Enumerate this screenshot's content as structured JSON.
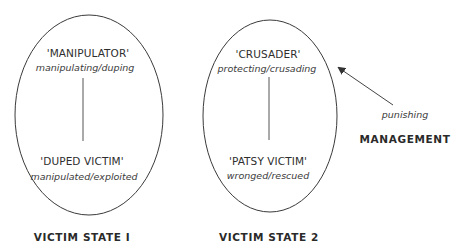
{
  "state1": {
    "top_role": "'MANIPULATOR'",
    "top_verb": "manipulating/duping",
    "bottom_role": "'DUPED VICTIM'",
    "bottom_verb": "manipulated/exploited",
    "title": "VICTIM STATE I"
  },
  "state2": {
    "top_role": "'CRUSADER'",
    "top_verb": "protecting/crusading",
    "bottom_role": "'PATSY VICTIM'",
    "bottom_verb": "wronged/rescued",
    "title": "VICTIM STATE 2"
  },
  "management": {
    "arrow_label": "punishing",
    "title": "MANAGEMENT"
  },
  "colors": {
    "line": "#3a3a3a",
    "text": "#333333",
    "background": "#ffffff"
  }
}
